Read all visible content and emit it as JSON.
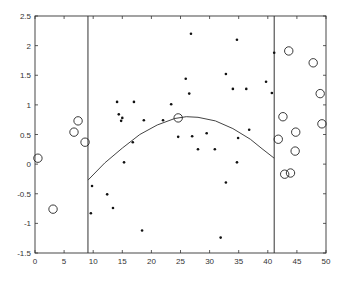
{
  "chart_data": {
    "type": "scatter",
    "title": "",
    "xlabel": "",
    "ylabel": "",
    "xlim": [
      0,
      50
    ],
    "ylim": [
      -1.5,
      2.5
    ],
    "grid": false,
    "legend": null,
    "xticks": [
      0,
      5,
      10,
      15,
      20,
      25,
      30,
      35,
      40,
      45,
      50
    ],
    "xtick_labels": [
      "0",
      "5",
      "10",
      "15",
      "20",
      "25",
      "30",
      "35",
      "40",
      "45",
      "50"
    ],
    "yticks": [
      -1.5,
      -1,
      -0.5,
      0,
      0.5,
      1,
      1.5,
      2,
      2.5
    ],
    "ytick_labels": [
      "-1.5",
      "-1",
      "-0.5",
      "0",
      "0.5",
      "1",
      "1.5",
      "2",
      "2.5"
    ],
    "vertical_lines": [
      9.1,
      41.1
    ],
    "series": [
      {
        "name": "inliers",
        "marker": "dot",
        "points": [
          [
            14.1,
            1.05
          ],
          [
            17.0,
            1.05
          ],
          [
            23.4,
            1.01
          ],
          [
            14.4,
            0.84
          ],
          [
            15.0,
            0.78
          ],
          [
            14.8,
            0.73
          ],
          [
            18.7,
            0.74
          ],
          [
            22.0,
            0.74
          ],
          [
            24.6,
            0.46
          ],
          [
            16.8,
            0.37
          ],
          [
            15.3,
            0.03
          ],
          [
            9.8,
            -0.37
          ],
          [
            12.4,
            -0.51
          ],
          [
            9.6,
            -0.83
          ],
          [
            13.4,
            -0.74
          ],
          [
            18.4,
            -1.12
          ],
          [
            26.8,
            2.2
          ],
          [
            34.7,
            2.1
          ],
          [
            41.1,
            1.88
          ],
          [
            25.9,
            1.44
          ],
          [
            32.8,
            1.52
          ],
          [
            26.5,
            1.19
          ],
          [
            34.0,
            1.27
          ],
          [
            36.3,
            1.27
          ],
          [
            39.7,
            1.39
          ],
          [
            40.7,
            1.2
          ],
          [
            27.0,
            0.47
          ],
          [
            29.5,
            0.52
          ],
          [
            28.0,
            0.25
          ],
          [
            30.9,
            0.25
          ],
          [
            34.9,
            0.44
          ],
          [
            36.8,
            0.58
          ],
          [
            34.7,
            0.03
          ],
          [
            32.8,
            -0.31
          ],
          [
            31.9,
            -1.24
          ]
        ]
      },
      {
        "name": "outliers",
        "marker": "circle",
        "points": [
          [
            0.5,
            0.1
          ],
          [
            3.1,
            -0.76
          ],
          [
            6.7,
            0.54
          ],
          [
            7.4,
            0.73
          ],
          [
            8.6,
            0.37
          ],
          [
            24.6,
            0.78
          ],
          [
            43.6,
            1.91
          ],
          [
            47.8,
            1.71
          ],
          [
            49.0,
            1.19
          ],
          [
            42.6,
            0.8
          ],
          [
            49.3,
            0.68
          ],
          [
            44.8,
            0.54
          ],
          [
            41.8,
            0.42
          ],
          [
            44.7,
            0.22
          ],
          [
            42.9,
            -0.17
          ],
          [
            43.9,
            -0.15
          ]
        ]
      }
    ],
    "fit_curve": {
      "name": "quadratic fit",
      "x_range": [
        9.1,
        41.1
      ],
      "points": [
        [
          9.1,
          -0.27
        ],
        [
          12.0,
          0.02
        ],
        [
          15.0,
          0.27
        ],
        [
          18.0,
          0.5
        ],
        [
          21.0,
          0.66
        ],
        [
          24.0,
          0.77
        ],
        [
          26.0,
          0.8
        ],
        [
          28.0,
          0.79
        ],
        [
          31.0,
          0.73
        ],
        [
          34.0,
          0.6
        ],
        [
          37.0,
          0.42
        ],
        [
          39.0,
          0.26
        ],
        [
          41.1,
          0.1
        ]
      ]
    }
  }
}
